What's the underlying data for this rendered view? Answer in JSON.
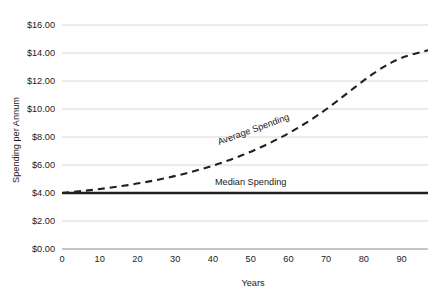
{
  "chart_data": {
    "type": "line",
    "title": "",
    "xlabel": "Years",
    "ylabel": "Spending per Annum",
    "xlim": [
      0,
      97
    ],
    "ylim": [
      0,
      16
    ],
    "grid": true,
    "legend_position": "inline-annotations",
    "x_tick_labels": [
      "0",
      "10",
      "20",
      "30",
      "40",
      "50",
      "60",
      "70",
      "80",
      "90"
    ],
    "x_tick_values": [
      0,
      10,
      20,
      30,
      40,
      50,
      60,
      70,
      80,
      90
    ],
    "y_tick_labels": [
      "$0.00",
      "$2.00",
      "$4.00",
      "$6.00",
      "$8.00",
      "$10.00",
      "$12.00",
      "$14.00",
      "$16.00"
    ],
    "y_tick_values": [
      0,
      2,
      4,
      6,
      8,
      10,
      12,
      14,
      16
    ],
    "series": [
      {
        "name": "Average Spending",
        "style": "dashed",
        "color": "#202020",
        "label_text": "Average Spending",
        "x": [
          0,
          5,
          10,
          15,
          20,
          25,
          30,
          35,
          40,
          45,
          50,
          55,
          60,
          65,
          70,
          75,
          80,
          85,
          90,
          97
        ],
        "values": [
          4.0,
          4.13,
          4.28,
          4.46,
          4.67,
          4.92,
          5.21,
          5.55,
          5.95,
          6.41,
          6.94,
          7.55,
          8.25,
          9.05,
          9.96,
          11.0,
          12.05,
          13.0,
          13.7,
          14.2
        ]
      },
      {
        "name": "Median Spending",
        "style": "solid",
        "color": "#202020",
        "label_text": "Median Spending",
        "x": [
          0,
          97
        ],
        "values": [
          4.0,
          4.0
        ]
      }
    ],
    "annotations": [
      {
        "text": "Average Spending",
        "x": 51,
        "y": 8.35,
        "rotation": -20
      },
      {
        "text": "Median Spending",
        "x": 50,
        "y": 4.55,
        "rotation": 0
      }
    ]
  }
}
